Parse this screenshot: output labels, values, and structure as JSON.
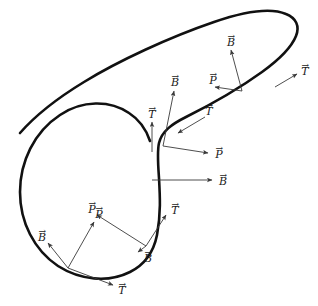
{
  "figure": {
    "background_color": "#ffffff",
    "curve_color": "#111111",
    "vector_color": "#3a3a3a",
    "label_color": "#1a1a1a",
    "width": 318,
    "height": 306,
    "curve": {
      "name": "closed-space-curve",
      "stroke_width": 2.6,
      "path": "M 150 141 C 146 129 140 120 129 113 C 110 100 82 100 60 115 C 34 132 20 162 20 192 C 20 222 34 250 58 266 C 80 280 108 283 130 272 C 146 264 154 250 157 235 C 161 214 160 196 159 178 C 158 164 157 152 159 143 C 162 131 172 124 186 117 C 212 104 244 85 262 72 C 280 59 292 46 296 36 C 300 26 296 18 286 14 C 272 8 246 11 214 22 C 170 37 118 61 84 82 C 56 99 34 117 20 133"
    },
    "frames": [
      {
        "id": "frame-bottom-left",
        "origin": {
          "x": 68,
          "y": 268
        },
        "vectors": [
          {
            "id": "bl-B",
            "symbol": "B",
            "from": {
              "x": 68,
              "y": 268
            },
            "to": {
              "x": 48,
              "y": 243
            },
            "label": {
              "x": 42,
              "y": 236
            }
          },
          {
            "id": "bl-P",
            "symbol": "P",
            "from": {
              "x": 68,
              "y": 268
            },
            "to": {
              "x": 94,
              "y": 222
            },
            "label": {
              "x": 99,
              "y": 213
            }
          },
          {
            "id": "bl-T",
            "symbol": "T",
            "from": {
              "x": 68,
              "y": 268
            },
            "to": {
              "x": 113,
              "y": 285
            },
            "label": {
              "x": 122,
              "y": 289
            }
          }
        ]
      },
      {
        "id": "frame-lower-middle",
        "origin": {
          "x": 146,
          "y": 246
        },
        "vectors": [
          {
            "id": "lm-B",
            "symbol": "B",
            "from": {
              "x": 146,
              "y": 246
            },
            "to": {
              "x": 138,
              "y": 252
            },
            "label": {
              "x": 148,
              "y": 257
            }
          },
          {
            "id": "lm-P",
            "symbol": "P",
            "from": {
              "x": 146,
              "y": 246
            },
            "to": {
              "x": 97,
              "y": 215
            },
            "label": {
              "x": 92,
              "y": 208
            }
          },
          {
            "id": "lm-T",
            "symbol": "T",
            "from": {
              "x": 146,
              "y": 246
            },
            "to": {
              "x": 166,
              "y": 215
            },
            "label": {
              "x": 175,
              "y": 209
            }
          }
        ]
      },
      {
        "id": "frame-middle-vertical",
        "origin": {
          "x": 152,
          "y": 180
        },
        "vectors": [
          {
            "id": "mv-B",
            "symbol": "B",
            "from": {
              "x": 152,
              "y": 180
            },
            "to": {
              "x": 212,
              "y": 180
            },
            "label": {
              "x": 223,
              "y": 180
            }
          }
        ]
      },
      {
        "id": "frame-inflection",
        "origin": {
          "x": 163,
          "y": 143
        },
        "vectors": [
          {
            "id": "if-T",
            "symbol": "T",
            "from": {
              "x": 152,
              "y": 152
            },
            "to": {
              "x": 152,
              "y": 122
            },
            "label": {
              "x": 152,
              "y": 113
            }
          },
          {
            "id": "if-B",
            "symbol": "B",
            "from": {
              "x": 163,
              "y": 146
            },
            "to": {
              "x": 174,
              "y": 91
            },
            "label": {
              "x": 175,
              "y": 81
            }
          },
          {
            "id": "if-P",
            "symbol": "P",
            "from": {
              "x": 163,
              "y": 146
            },
            "to": {
              "x": 208,
              "y": 153
            },
            "label": {
              "x": 219,
              "y": 153
            }
          },
          {
            "id": "if-T2",
            "symbol": "T",
            "from": {
              "x": 205,
              "y": 117
            },
            "to": {
              "x": 178,
              "y": 133
            },
            "label": {
              "x": 209,
              "y": 110
            }
          }
        ]
      },
      {
        "id": "frame-upper-right",
        "origin": {
          "x": 242,
          "y": 91
        },
        "vectors": [
          {
            "id": "ur-B",
            "symbol": "B",
            "from": {
              "x": 242,
              "y": 91
            },
            "to": {
              "x": 231,
              "y": 50
            },
            "label": {
              "x": 231,
              "y": 41
            }
          },
          {
            "id": "ur-P",
            "symbol": "P",
            "from": {
              "x": 242,
              "y": 91
            },
            "to": {
              "x": 215,
              "y": 87
            },
            "label": {
              "x": 213,
              "y": 79
            }
          },
          {
            "id": "ur-T",
            "symbol": "T",
            "from": {
              "x": 275,
              "y": 87
            },
            "to": {
              "x": 297,
              "y": 74
            },
            "label": {
              "x": 305,
              "y": 70
            }
          }
        ]
      }
    ],
    "legend": {
      "tangent_symbol": "T",
      "principal_normal_symbol": "P",
      "binormal_symbol": "B",
      "accent": "→"
    }
  }
}
